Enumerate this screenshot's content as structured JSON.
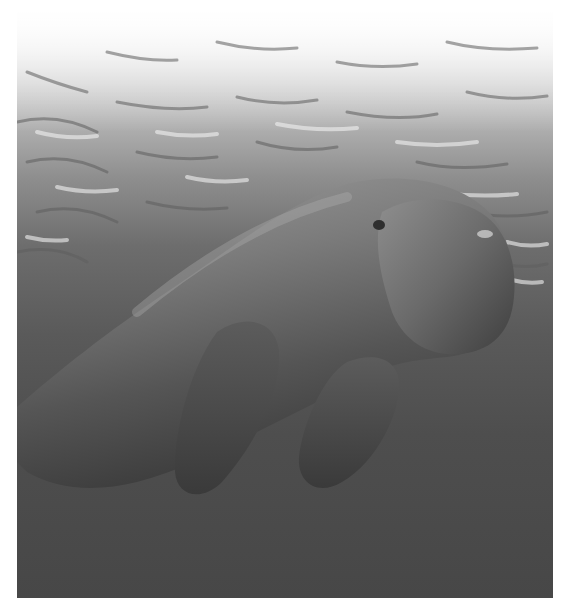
{
  "image": {
    "subject": "dugong swimming underwater below rippled water surface",
    "style": "grayscale photograph",
    "colors": {
      "surface_light": "#f5f5f5",
      "water_mid": "#8a8a8a",
      "water_deep": "#474747",
      "body_light": "#9a9a9a",
      "body_dark": "#3a3a3a"
    }
  }
}
